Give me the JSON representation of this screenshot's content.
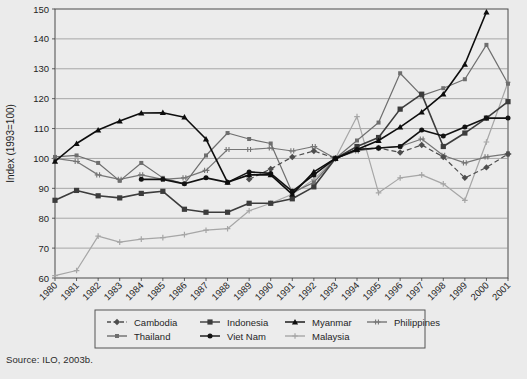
{
  "figure": {
    "source_note": "Source: ILO, 2003b.",
    "background_color": "#ebebeb",
    "plot_background_color": "#ececec"
  },
  "chart_data": {
    "type": "line",
    "title": "",
    "xlabel": "",
    "ylabel": "Index (1993=100)",
    "xlim": [
      1980,
      2001
    ],
    "ylim": [
      60,
      150
    ],
    "ytick_interval": 10,
    "grid": true,
    "legend_position": "bottom",
    "x": [
      1980,
      1981,
      1982,
      1983,
      1984,
      1985,
      1986,
      1987,
      1988,
      1989,
      1990,
      1991,
      1992,
      1993,
      1994,
      1995,
      1996,
      1997,
      1998,
      1999,
      2000,
      2001
    ],
    "categories": [
      "1980",
      "1981",
      "1982",
      "1983",
      "1984",
      "1985",
      "1986",
      "1987",
      "1988",
      "1989",
      "1990",
      "1991",
      "1992",
      "1993",
      "1994",
      "1995",
      "1996",
      "1997",
      "1998",
      "1999",
      "2000",
      "2001"
    ],
    "yticks": [
      60,
      70,
      80,
      90,
      100,
      110,
      120,
      130,
      140,
      150
    ],
    "series": [
      {
        "name": "Cambodia",
        "color": "#4d4d4d",
        "line_style": "dashed",
        "marker": "diamond",
        "values": [
          null,
          null,
          null,
          null,
          null,
          null,
          null,
          null,
          null,
          93.0,
          96.5,
          100.5,
          102.5,
          100.0,
          103.0,
          103.5,
          102.0,
          104.5,
          100.5,
          93.5,
          97.0,
          101.5
        ]
      },
      {
        "name": "Indonesia",
        "color": "#3c3c3c",
        "line_style": "solid",
        "marker": "square",
        "values": [
          86.0,
          89.3,
          87.5,
          86.8,
          88.3,
          89.0,
          83.0,
          82.0,
          82.0,
          85.0,
          85.0,
          86.5,
          90.5,
          100.0,
          104.0,
          107.0,
          116.5,
          121.5,
          104.0,
          108.5,
          113.5,
          119.0
        ]
      },
      {
        "name": "Myanmar",
        "color": "#0d0d0d",
        "line_style": "solid",
        "marker": "triangle",
        "values": [
          99.0,
          105.0,
          109.5,
          112.5,
          115.2,
          115.3,
          113.8,
          106.5,
          92.0,
          94.5,
          94.5,
          88.0,
          95.5,
          100.0,
          103.0,
          106.0,
          110.5,
          115.5,
          121.5,
          131.5,
          149.0,
          null
        ]
      },
      {
        "name": "Philippines",
        "color": "#767676",
        "line_style": "solid",
        "marker": "plus-bar",
        "values": [
          100.0,
          99.0,
          94.5,
          93.0,
          94.5,
          93.0,
          93.5,
          96.0,
          103.0,
          103.0,
          103.5,
          102.5,
          104.0,
          100.0,
          102.5,
          103.5,
          104.0,
          106.5,
          101.0,
          98.5,
          100.5,
          101.5
        ]
      },
      {
        "name": "Thailand",
        "color": "#6e6e6e",
        "line_style": "solid",
        "marker": "square-small",
        "values": [
          100.5,
          101.0,
          98.5,
          92.5,
          98.5,
          93.5,
          91.5,
          101.0,
          108.5,
          106.5,
          105.0,
          88.5,
          92.0,
          100.0,
          106.0,
          112.0,
          128.5,
          121.0,
          123.5,
          126.5,
          138.0,
          125.0
        ]
      },
      {
        "name": "Viet Nam",
        "color": "#121212",
        "line_style": "solid",
        "marker": "circle",
        "values": [
          null,
          null,
          null,
          null,
          93.0,
          93.0,
          91.5,
          93.5,
          92.0,
          95.5,
          95.0,
          89.0,
          94.5,
          100.0,
          103.0,
          103.5,
          104.0,
          109.5,
          107.5,
          110.5,
          113.5,
          113.5
        ]
      },
      {
        "name": "Malaysia",
        "color": "#a6a6a6",
        "line_style": "solid",
        "marker": "plus",
        "values": [
          60.8,
          62.5,
          74.0,
          72.0,
          73.0,
          73.5,
          74.5,
          76.0,
          76.5,
          82.5,
          85.0,
          88.0,
          93.0,
          100.0,
          114.0,
          88.5,
          93.5,
          94.5,
          91.5,
          86.0,
          105.5,
          125.5
        ]
      }
    ],
    "legend": [
      {
        "label": "Cambodia",
        "marker": "diamond",
        "line_style": "dashed",
        "color": "#4d4d4d"
      },
      {
        "label": "Indonesia",
        "marker": "square",
        "line_style": "solid",
        "color": "#3c3c3c"
      },
      {
        "label": "Myanmar",
        "marker": "triangle",
        "line_style": "solid",
        "color": "#0d0d0d"
      },
      {
        "label": "Philippines",
        "marker": "plus-bar",
        "line_style": "solid",
        "color": "#767676"
      },
      {
        "label": "Thailand",
        "marker": "square-small",
        "line_style": "solid",
        "color": "#6e6e6e"
      },
      {
        "label": "Viet Nam",
        "marker": "circle",
        "line_style": "solid",
        "color": "#121212"
      },
      {
        "label": "Malaysia",
        "marker": "plus",
        "line_style": "solid",
        "color": "#a6a6a6"
      }
    ]
  }
}
